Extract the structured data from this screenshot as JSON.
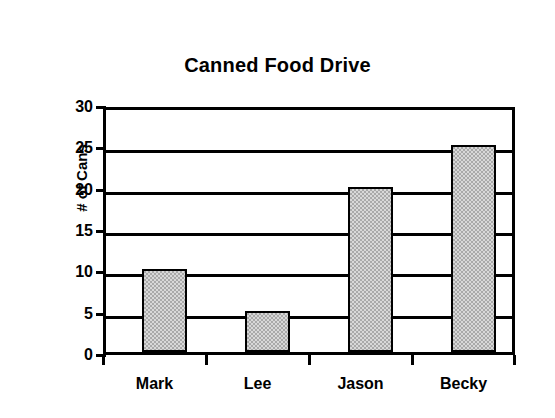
{
  "chart_data": {
    "type": "bar",
    "title": "Canned Food Drive",
    "xlabel": "",
    "ylabel": "# of Cans",
    "categories": [
      "Mark",
      "Lee",
      "Jason",
      "Becky"
    ],
    "values": [
      10,
      5,
      20,
      25
    ],
    "ylim": [
      0,
      30
    ],
    "ytick_step": 5,
    "yticks": [
      30,
      25,
      20,
      15,
      10,
      5,
      0
    ],
    "grid": true,
    "grid_orientation": "horizontal",
    "legend": false,
    "legend_position": "none",
    "series": [
      {
        "name": "# of Cans",
        "values": [
          10,
          5,
          20,
          25
        ],
        "fill_color": "#a9a9a9",
        "fill_pattern": "dithered-gray",
        "border_color": "#000000"
      }
    ]
  },
  "style": {
    "background": "#ffffff",
    "axis_color": "#000000",
    "text_color": "#000000",
    "bar_fill": "#a9a9a9",
    "bar_border": "#000000"
  }
}
